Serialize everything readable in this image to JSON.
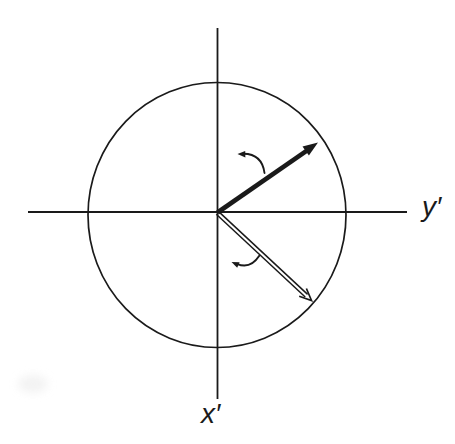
{
  "diagram": {
    "type": "coordinate-rotation-diagram",
    "axis_labels": {
      "horizontal_axis": "y′",
      "vertical_axis": "x′"
    },
    "colors": {
      "ink": "#1a1a1a",
      "background": "#ffffff"
    },
    "elements": {
      "circle": "reference-circle",
      "solid_vector": "solid arrow toward upper right",
      "open_vector": "open double-line arrow toward lower right",
      "upper_rotation_arrow": "small counterclockwise curved arrow above solid vector",
      "lower_rotation_arrow": "small counterclockwise curved arrow above open vector"
    }
  }
}
